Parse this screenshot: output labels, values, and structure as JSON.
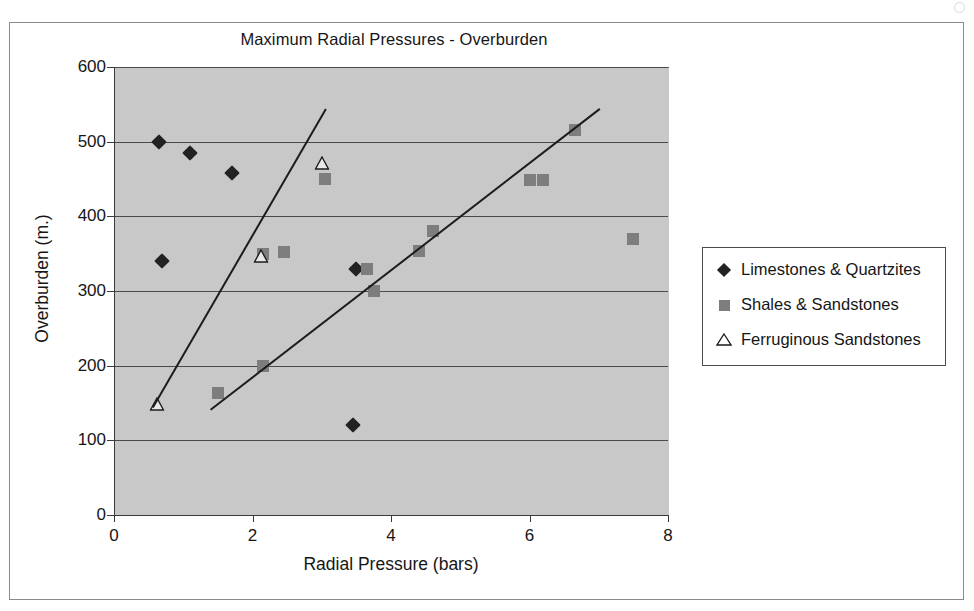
{
  "figure": {
    "title": "Maximum Radial Pressures - Overburden"
  },
  "chart_data": {
    "type": "scatter",
    "title": "Maximum Radial Pressures - Overburden",
    "xlabel": "Radial Pressure (bars)",
    "ylabel": "Overburden (m.)",
    "xlim": [
      0,
      8
    ],
    "ylim": [
      0,
      600
    ],
    "xticks": [
      0,
      2,
      4,
      6,
      8
    ],
    "yticks": [
      0,
      100,
      200,
      300,
      400,
      500,
      600
    ],
    "grid": "horizontal",
    "plot_background": "#c8c8c8",
    "legend_position": "right",
    "series": [
      {
        "name": "Limestones & Quartzites",
        "marker": "filled-diamond",
        "color": "#222222",
        "points": [
          [
            0.65,
            500
          ],
          [
            1.1,
            485
          ],
          [
            1.7,
            458
          ],
          [
            0.7,
            340
          ],
          [
            3.5,
            330
          ],
          [
            3.45,
            120
          ]
        ]
      },
      {
        "name": "Shales & Sandstones",
        "marker": "filled-square",
        "color": "#7d7d7d",
        "points": [
          [
            1.5,
            163
          ],
          [
            2.15,
            200
          ],
          [
            2.15,
            350
          ],
          [
            2.45,
            352
          ],
          [
            3.05,
            450
          ],
          [
            3.65,
            330
          ],
          [
            3.75,
            300
          ],
          [
            4.4,
            353
          ],
          [
            4.6,
            380
          ],
          [
            6.0,
            449
          ],
          [
            6.2,
            449
          ],
          [
            6.65,
            515
          ],
          [
            7.5,
            370
          ]
        ]
      },
      {
        "name": "Ferruginous Sandstones",
        "marker": "open-triangle",
        "color": "#ffffff",
        "points": [
          [
            0.62,
            148
          ],
          [
            2.12,
            347
          ],
          [
            3.0,
            472
          ]
        ]
      }
    ],
    "trendlines": [
      {
        "name": "limestones-quartzites-trend",
        "from": [
          0.55,
          145
        ],
        "to": [
          3.05,
          545
        ]
      },
      {
        "name": "shales-sandstones-trend",
        "from": [
          1.38,
          142
        ],
        "to": [
          7.0,
          545
        ]
      }
    ]
  },
  "legend": {
    "items": [
      {
        "label": "Limestones & Quartzites",
        "key": "diamond-marker-icon"
      },
      {
        "label": "Shales & Sandstones",
        "key": "square-marker-icon"
      },
      {
        "label": "Ferruginous  Sandstones",
        "key": "triangle-marker-icon"
      }
    ]
  }
}
